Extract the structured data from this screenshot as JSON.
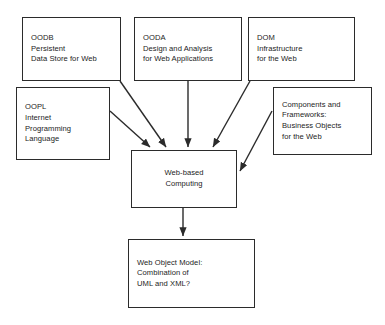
{
  "diagram": {
    "background_color": "#ffffff",
    "line_color": "#2b2b2b",
    "text_color": "#1c1c1c",
    "nodes": [
      {
        "id": "oodb",
        "name": "oodb-box",
        "lines": [
          "OODB",
          "Persistent",
          "Data Store for Web"
        ],
        "x": 22,
        "y": 17,
        "w": 99,
        "h": 64,
        "align": "left"
      },
      {
        "id": "ooda",
        "name": "ooda-box",
        "lines": [
          "OODA",
          "Design and Analysis",
          "for Web Applications"
        ],
        "x": 134,
        "y": 17,
        "w": 108,
        "h": 64,
        "align": "left"
      },
      {
        "id": "dom",
        "name": "dom-box",
        "lines": [
          "DOM",
          "Infrastructure",
          "for the Web"
        ],
        "x": 248,
        "y": 17,
        "w": 107,
        "h": 64,
        "align": "left"
      },
      {
        "id": "oopl",
        "name": "oopl-box",
        "lines": [
          "OOPL",
          "Internet",
          "Programming",
          "Language"
        ],
        "x": 16,
        "y": 87,
        "w": 94,
        "h": 73,
        "align": "left"
      },
      {
        "id": "components",
        "name": "components-frameworks-box",
        "lines": [
          "Components and",
          "Frameworks:",
          "Business Objects",
          "for the Web"
        ],
        "x": 273,
        "y": 87,
        "w": 99,
        "h": 68,
        "align": "left"
      },
      {
        "id": "webcomputing",
        "name": "web-based-computing-box",
        "lines": [
          "Web-based",
          "Computing"
        ],
        "x": 131,
        "y": 150,
        "w": 106,
        "h": 58,
        "align": "center"
      },
      {
        "id": "webobjectmodel",
        "name": "web-object-model-box",
        "lines": [
          "Web Object Model:",
          "Combination of",
          "UML and XML?"
        ],
        "x": 128,
        "y": 239,
        "w": 127,
        "h": 69,
        "align": "left"
      }
    ],
    "edges": [
      {
        "id": "oodb-to-web",
        "name": "arrow-oodb-to-web-based-computing",
        "from": "oodb",
        "to": "webcomputing",
        "points": "120,81 166,147",
        "arrowhead": "end"
      },
      {
        "id": "oopl-to-web",
        "name": "arrow-oopl-to-web-based-computing",
        "from": "oopl",
        "to": "webcomputing",
        "points": "110,111 150,147",
        "arrowhead": "end"
      },
      {
        "id": "ooda-to-web",
        "name": "arrow-ooda-to-web-based-computing",
        "from": "ooda",
        "to": "webcomputing",
        "points": "188,81 188,147",
        "arrowhead": "end"
      },
      {
        "id": "dom-to-web",
        "name": "arrow-dom-to-web-based-computing",
        "from": "dom",
        "to": "webcomputing",
        "points": "250,81 213,147",
        "arrowhead": "end"
      },
      {
        "id": "components-to-web",
        "name": "arrow-components-to-web-based-computing",
        "from": "components",
        "to": "webcomputing",
        "points": "272,111 240,171",
        "arrowhead": "end"
      },
      {
        "id": "web-to-model",
        "name": "arrow-web-based-computing-to-web-object-model",
        "from": "webcomputing",
        "to": "webobjectmodel",
        "points": "183,208 183,236",
        "arrowhead": "end"
      }
    ]
  }
}
